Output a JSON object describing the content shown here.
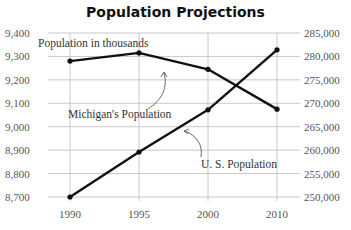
{
  "chart_data": {
    "type": "line",
    "title": "Population Projections",
    "subtitle": "",
    "xlabel": "",
    "ylabel_left": "",
    "ylabel_right": "",
    "categories": [
      "1990",
      "1995",
      "2000",
      "2010"
    ],
    "series": [
      {
        "name": "Michigan's Population",
        "axis": "left",
        "values": [
          9280,
          9315,
          9245,
          9075
        ]
      },
      {
        "name": "U. S. Population",
        "axis": "right",
        "values": [
          250000,
          259600,
          268600,
          281400
        ]
      }
    ],
    "left_axis": {
      "ylim": [
        8700,
        9400
      ],
      "ticks": [
        "9,400",
        "9,300",
        "9,200",
        "9,100",
        "9,000",
        "8,900",
        "8,800",
        "8,700"
      ]
    },
    "right_axis": {
      "ylim": [
        250000,
        285000
      ],
      "ticks": [
        "285,000",
        "280,000",
        "275,000",
        "270,000",
        "265,000",
        "260,000",
        "255,000",
        "250,000"
      ]
    },
    "annotations": [
      "Population in thousands",
      "Michigan's Population",
      "U. S. Population"
    ],
    "grid": true,
    "legend_position": "none (inline annotations)"
  },
  "labels": {
    "title": "Population Projections",
    "units_note": "Population in thousands",
    "michigan_label": "Michigan's Population",
    "us_label": "U. S. Population"
  }
}
